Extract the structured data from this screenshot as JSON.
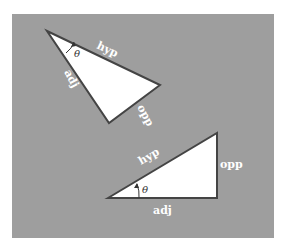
{
  "colors": {
    "background": "#ffffff",
    "panel": "#9e9e9e",
    "triangle_fill": "#ffffff",
    "triangle_stroke": "#444444",
    "label": "#ffffff",
    "angle_label": "#333333"
  },
  "triangles": [
    {
      "name": "rotated-triangle",
      "labels": {
        "hypotenuse": "hyp",
        "adjacent": "adj",
        "opposite": "opp",
        "angle": "θ"
      }
    },
    {
      "name": "upright-triangle",
      "labels": {
        "hypotenuse": "hyp",
        "adjacent": "adj",
        "opposite": "opp",
        "angle": "θ"
      }
    }
  ]
}
